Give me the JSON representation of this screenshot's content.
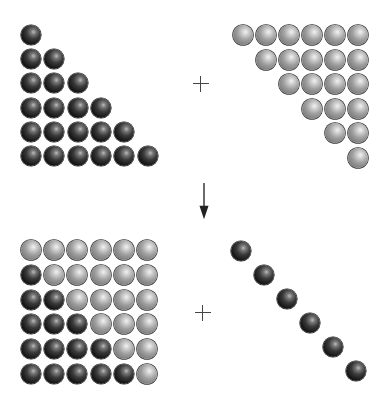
{
  "diagram": {
    "n": 6,
    "colors": {
      "dark_ball": "#1a1a1a",
      "gray_ball": "#9e9e9e",
      "operator": "#444444"
    },
    "panels": [
      {
        "id": "top-left",
        "label": "lower-triangle-dark",
        "color": "dark",
        "origin": [
          21,
          25
        ],
        "step": [
          23.3,
          24.2
        ],
        "cells": [
          [
            0,
            0
          ],
          [
            1,
            0
          ],
          [
            1,
            1
          ],
          [
            2,
            0
          ],
          [
            2,
            1
          ],
          [
            2,
            2
          ],
          [
            3,
            0
          ],
          [
            3,
            1
          ],
          [
            3,
            2
          ],
          [
            3,
            3
          ],
          [
            4,
            0
          ],
          [
            4,
            1
          ],
          [
            4,
            2
          ],
          [
            4,
            3
          ],
          [
            4,
            4
          ],
          [
            5,
            0
          ],
          [
            5,
            1
          ],
          [
            5,
            2
          ],
          [
            5,
            3
          ],
          [
            5,
            4
          ],
          [
            5,
            5
          ]
        ]
      },
      {
        "id": "top-right",
        "label": "upper-triangle-gray",
        "color": "gray",
        "origin": [
          233,
          25
        ],
        "step": [
          23,
          24.6
        ],
        "cells": [
          [
            0,
            0
          ],
          [
            0,
            1
          ],
          [
            0,
            2
          ],
          [
            0,
            3
          ],
          [
            0,
            4
          ],
          [
            0,
            5
          ],
          [
            1,
            1
          ],
          [
            1,
            2
          ],
          [
            1,
            3
          ],
          [
            1,
            4
          ],
          [
            1,
            5
          ],
          [
            2,
            2
          ],
          [
            2,
            3
          ],
          [
            2,
            4
          ],
          [
            2,
            5
          ],
          [
            3,
            3
          ],
          [
            3,
            4
          ],
          [
            3,
            5
          ],
          [
            4,
            4
          ],
          [
            4,
            5
          ],
          [
            5,
            5
          ]
        ]
      },
      {
        "id": "bottom-left",
        "label": "square-mixed",
        "origin": [
          21,
          240
        ],
        "step": [
          23.2,
          24.8
        ],
        "dark_cells": [
          [
            1,
            0
          ],
          [
            2,
            0
          ],
          [
            2,
            1
          ],
          [
            3,
            0
          ],
          [
            3,
            1
          ],
          [
            3,
            2
          ],
          [
            4,
            0
          ],
          [
            4,
            1
          ],
          [
            4,
            2
          ],
          [
            4,
            3
          ],
          [
            5,
            0
          ],
          [
            5,
            1
          ],
          [
            5,
            2
          ],
          [
            5,
            3
          ],
          [
            5,
            4
          ]
        ],
        "gray_cells": [
          [
            0,
            0
          ],
          [
            0,
            1
          ],
          [
            0,
            2
          ],
          [
            0,
            3
          ],
          [
            0,
            4
          ],
          [
            0,
            5
          ],
          [
            1,
            1
          ],
          [
            1,
            2
          ],
          [
            1,
            3
          ],
          [
            1,
            4
          ],
          [
            1,
            5
          ],
          [
            2,
            2
          ],
          [
            2,
            3
          ],
          [
            2,
            4
          ],
          [
            2,
            5
          ],
          [
            3,
            3
          ],
          [
            3,
            4
          ],
          [
            3,
            5
          ],
          [
            4,
            4
          ],
          [
            4,
            5
          ],
          [
            5,
            5
          ]
        ]
      },
      {
        "id": "bottom-right",
        "label": "diagonal-dark",
        "color": "dark",
        "origin": [
          231,
          241
        ],
        "step": [
          23,
          24
        ],
        "cells": [
          [
            0,
            0
          ],
          [
            1,
            1
          ],
          [
            2,
            2
          ],
          [
            3,
            3
          ],
          [
            4,
            4
          ],
          [
            5,
            5
          ]
        ]
      }
    ],
    "operators": [
      {
        "type": "plus",
        "name": "plus-sign-top",
        "center": [
          201,
          84
        ]
      },
      {
        "type": "arrow-down",
        "name": "down-arrow",
        "x": 204,
        "y_start": 183,
        "y_end": 221
      },
      {
        "type": "plus",
        "name": "plus-sign-bottom",
        "center": [
          203,
          313
        ]
      }
    ]
  }
}
